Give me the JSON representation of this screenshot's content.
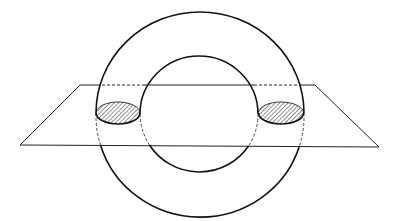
{
  "diagram": {
    "width": 399,
    "height": 221,
    "colors": {
      "background": "#ffffff",
      "stroke": "#111111",
      "plane_stroke": "#222222",
      "hatch": "#333333"
    },
    "torus": {
      "outer": {
        "cx": 200,
        "cy": 113,
        "rx": 104,
        "ry": 101
      },
      "inner": {
        "cx": 199,
        "cy": 114,
        "rx": 59,
        "ry": 58
      }
    },
    "plane": {
      "back_y": 85,
      "front_y": 145,
      "corners": {
        "back_left": [
          80,
          85
        ],
        "back_right": [
          315,
          85
        ],
        "front_right": [
          379,
          147
        ],
        "front_left": [
          20,
          145
        ]
      }
    },
    "cross_sections": [
      {
        "name": "left",
        "cx": 118,
        "cy": 113,
        "rx": 22,
        "ry": 11,
        "fill": "hatched"
      },
      {
        "name": "right",
        "cx": 281,
        "cy": 113,
        "rx": 22,
        "ry": 11,
        "fill": "hatched"
      }
    ]
  }
}
